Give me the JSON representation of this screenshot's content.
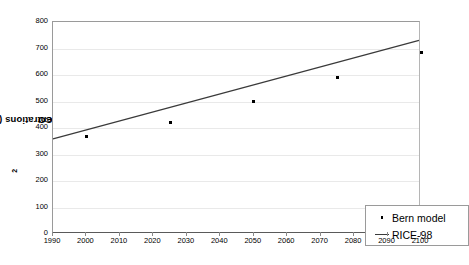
{
  "chart_data": {
    "type": "scatter",
    "title": "",
    "xlabel": "",
    "ylabel": "CO2 concentrations (ppmv)",
    "ylabel_prefix": "CO",
    "ylabel_sub": "2",
    "ylabel_suffix": " concentrations (ppmv)",
    "xlim": [
      1990,
      2100
    ],
    "ylim": [
      0,
      800
    ],
    "x_ticks": [
      1990,
      2000,
      2010,
      2020,
      2030,
      2040,
      2050,
      2060,
      2070,
      2080,
      2090,
      2100
    ],
    "y_ticks": [
      0,
      100,
      200,
      300,
      400,
      500,
      600,
      700,
      800
    ],
    "grid": true,
    "legend_position": "bottom-right",
    "series": [
      {
        "name": "Bern model",
        "type": "scatter",
        "marker": "dot",
        "color": "#000000",
        "x": [
          2000,
          2025,
          2050,
          2075,
          2100
        ],
        "values": [
          368,
          422,
          500,
          590,
          685
        ]
      },
      {
        "name": "RICE-98",
        "type": "line",
        "color": "#3a3a3a",
        "x": [
          1990,
          2100
        ],
        "values": [
          355,
          730
        ]
      }
    ]
  },
  "legend": {
    "items": [
      {
        "label": "Bern model",
        "key": "dot-marker"
      },
      {
        "label": "RICE-98",
        "key": "line-marker"
      }
    ]
  }
}
